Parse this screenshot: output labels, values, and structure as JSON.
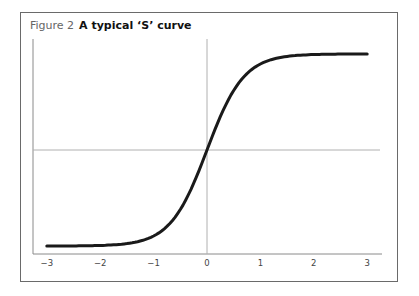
{
  "figure": {
    "label": "Figure 2",
    "title": "A typical ‘S’ curve"
  },
  "chart_data": {
    "type": "line",
    "xlabel": "",
    "ylabel": "",
    "xlim": [
      -3,
      3
    ],
    "x_ticks": [
      "−3",
      "−2",
      "−1",
      "0",
      "1",
      "2",
      "3"
    ],
    "y_ticks": [],
    "grid": false,
    "reference_lines": {
      "vertical_at_x": 0,
      "horizontal_at_midpoint": true
    },
    "series": [
      {
        "name": "S curve",
        "x": [
          -3,
          -2.5,
          -2,
          -1.5,
          -1,
          -0.5,
          0,
          0.5,
          1,
          1.5,
          2,
          2.5,
          3
        ],
        "y": [
          -0.97,
          -0.96,
          -0.94,
          -0.9,
          -0.79,
          -0.55,
          0,
          0.55,
          0.81,
          0.92,
          0.96,
          0.985,
          0.99
        ]
      }
    ],
    "colors": {
      "curve": "#1a1a1a",
      "axes": "#888888",
      "frame": "#6a6a6a"
    }
  }
}
